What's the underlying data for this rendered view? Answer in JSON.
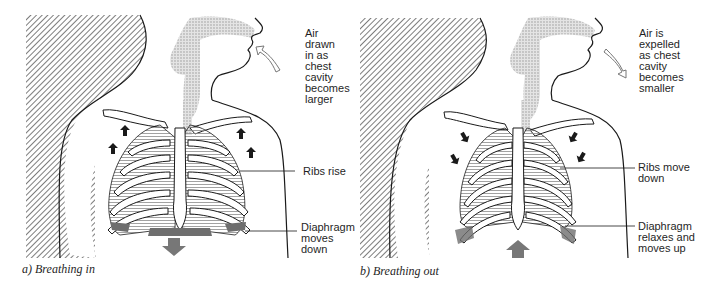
{
  "figure": {
    "panels": [
      {
        "id": "a",
        "caption": "a) Breathing in",
        "air_label": "Air\ndrawn\nin as\nchest\ncavity\nbecomes\nlarger",
        "ribs_label": "Ribs rise",
        "diaphragm_label": "Diaphragm\nmoves\ndown",
        "air_arrow_direction": "inward",
        "rib_arrow_direction": "up",
        "diaphragm_arrow_direction": "down"
      },
      {
        "id": "b",
        "caption": "b) Breathing out",
        "air_label": "Air is\nexpelled\nas chest\ncavity\nbecomes\nsmaller",
        "ribs_label": "Ribs move\ndown",
        "diaphragm_label": "Diaphragm\nrelaxes and\nmoves up",
        "air_arrow_direction": "outward",
        "rib_arrow_direction": "down",
        "diaphragm_arrow_direction": "up"
      }
    ],
    "colors": {
      "line": "#1a1a1a",
      "hatch": "#555555",
      "airway": "#c8c8c8",
      "diaphragm": "#6e6e6e",
      "arrow_fill": "#777777",
      "lung_lines": "#8a8a8a"
    }
  }
}
